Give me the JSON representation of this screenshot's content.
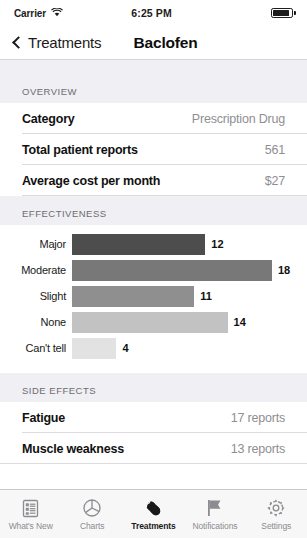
{
  "status_bar": {
    "carrier": "Carrier",
    "wifi_icon": "wifi-icon",
    "time": "6:25 PM",
    "battery_icon": "battery-icon"
  },
  "nav_bar": {
    "back_icon": "chevron-left-icon",
    "back_label": "Treatments",
    "title": "Baclofen"
  },
  "overview": {
    "header": "OVERVIEW",
    "rows": [
      {
        "label": "Category",
        "value": "Prescription Drug"
      },
      {
        "label": "Total patient reports",
        "value": "561"
      },
      {
        "label": "Average cost per month",
        "value": "$27"
      }
    ]
  },
  "effectiveness": {
    "header": "EFFECTIVENESS"
  },
  "chart_data": {
    "type": "bar",
    "orientation": "horizontal",
    "title": "EFFECTIVENESS",
    "categories": [
      "Major",
      "Moderate",
      "Slight",
      "None",
      "Can't tell"
    ],
    "values": [
      12,
      18,
      11,
      14,
      4
    ],
    "colors": [
      "#4d4d4d",
      "#787878",
      "#8f8f8f",
      "#c2c2c2",
      "#e2e2e2"
    ],
    "xlabel": "",
    "ylabel": "",
    "xlim": [
      0,
      18
    ],
    "grid": false,
    "legend": "none"
  },
  "side_effects": {
    "header": "SIDE EFFECTS",
    "rows": [
      {
        "label": "Fatigue",
        "value": "17 reports"
      },
      {
        "label": "Muscle weakness",
        "value": "13 reports"
      }
    ]
  },
  "tab_bar": {
    "tabs": [
      {
        "label": "What's New",
        "icon": "list-icon",
        "active": false
      },
      {
        "label": "Charts",
        "icon": "pie-chart-icon",
        "active": false
      },
      {
        "label": "Treatments",
        "icon": "pill-icon",
        "active": true
      },
      {
        "label": "Notifications",
        "icon": "flag-icon",
        "active": false
      },
      {
        "label": "Settings",
        "icon": "gear-icon",
        "active": false
      }
    ]
  }
}
